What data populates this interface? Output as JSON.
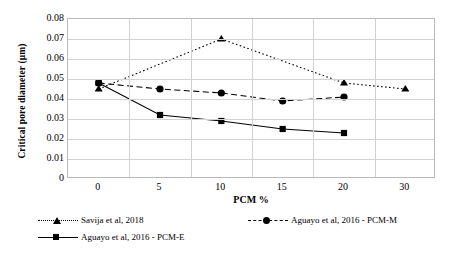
{
  "chart_data": {
    "type": "line",
    "title": "",
    "xlabel": "PCM %",
    "ylabel": "Critical pore diameter (µm)",
    "categories": [
      "0",
      "5",
      "10",
      "15",
      "20",
      "30"
    ],
    "ylim": [
      0,
      0.08
    ],
    "yticks": [
      "0.08",
      "0.07",
      "0.06",
      "0.05",
      "0.04",
      "0.03",
      "0.02",
      "0.01",
      "0"
    ],
    "ytick_values": [
      0.08,
      0.07,
      0.06,
      0.05,
      0.04,
      0.03,
      0.02,
      0.01,
      0
    ],
    "grid": "horizontal-and-vertical",
    "legend_position": "bottom",
    "series": [
      {
        "name": "Savija et al, 2018",
        "marker": "triangle",
        "linestyle": "dotted",
        "color": "#000000",
        "x": [
          "0",
          "10",
          "20",
          "30"
        ],
        "values": [
          0.045,
          0.07,
          0.048,
          0.045
        ]
      },
      {
        "name": "Aguayo et al, 2016 -  PCM-M",
        "marker": "circle",
        "linestyle": "dashed",
        "color": "#000000",
        "x": [
          "0",
          "5",
          "10",
          "15",
          "20"
        ],
        "values": [
          0.048,
          0.045,
          0.043,
          0.039,
          0.041
        ]
      },
      {
        "name": "Aguayo et al, 2016 -  PCM-E",
        "marker": "square",
        "linestyle": "solid",
        "color": "#000000",
        "x": [
          "0",
          "5",
          "10",
          "15",
          "20"
        ],
        "values": [
          0.048,
          0.032,
          0.029,
          0.025,
          0.023
        ]
      }
    ]
  },
  "legend": {
    "items": [
      {
        "label": "Savija et al, 2018",
        "marker": "triangle",
        "linestyle": "dotted"
      },
      {
        "label": "Aguayo et al, 2016 -  PCM-M",
        "marker": "circle",
        "linestyle": "dashed"
      },
      {
        "label": "Aguayo et al, 2016 -  PCM-E",
        "marker": "square",
        "linestyle": "solid"
      }
    ]
  }
}
